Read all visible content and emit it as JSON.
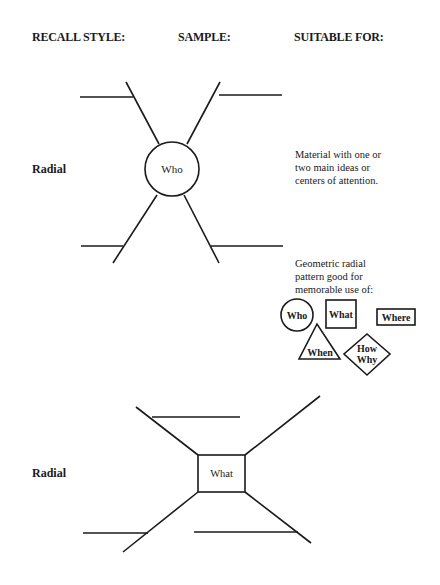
{
  "headers": {
    "recall_style": "RECALL STYLE:",
    "sample": "SAMPLE:",
    "suitable_for": "SUITABLE FOR:"
  },
  "rows": [
    {
      "style": "Radial",
      "center_label": "Who",
      "center_shape": "circle",
      "suitable_for": [
        "Material with one or",
        "two main ideas or",
        "centers of attention."
      ],
      "note": [
        "Geometric radial",
        "pattern good for",
        "memorable use of:"
      ],
      "shapes": [
        {
          "shape": "circle",
          "label": "Who"
        },
        {
          "shape": "square",
          "label": "What"
        },
        {
          "shape": "rectangle",
          "label": "Where"
        },
        {
          "shape": "triangle",
          "label": "When"
        },
        {
          "shape": "diamond",
          "label": "How Why",
          "lines": [
            "How",
            "Why"
          ]
        }
      ]
    },
    {
      "style": "Radial",
      "center_label": "What",
      "center_shape": "square"
    }
  ],
  "colors": {
    "ink": "#1a1a1a",
    "background": "#ffffff"
  }
}
